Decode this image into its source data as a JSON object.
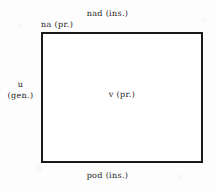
{
  "figure": {
    "kind": "grammatical-case-diagram",
    "background_color": "#fdfdfd",
    "ink_color": "#1b1b1b",
    "shape": {
      "name": "rectangle",
      "border_color": "#191919",
      "fill_color": "#ffffff"
    }
  },
  "labels": {
    "above": {
      "text": "nad (ins.)",
      "preposition": "nad",
      "case": "ins.",
      "position": "above-box-centered"
    },
    "top_left": {
      "text": "na (pr.)",
      "preposition": "na",
      "case": "pr.",
      "position": "on-top-edge-left"
    },
    "left": {
      "line1": "u",
      "line2": "(gen.)",
      "preposition": "u",
      "case": "gen.",
      "position": "left-of-box"
    },
    "inside": {
      "text": "v (pr.)",
      "preposition": "v",
      "case": "pr.",
      "position": "inside-box-centered"
    },
    "below": {
      "text": "pod (ins.)",
      "preposition": "pod",
      "case": "ins.",
      "position": "below-box-centered"
    }
  }
}
